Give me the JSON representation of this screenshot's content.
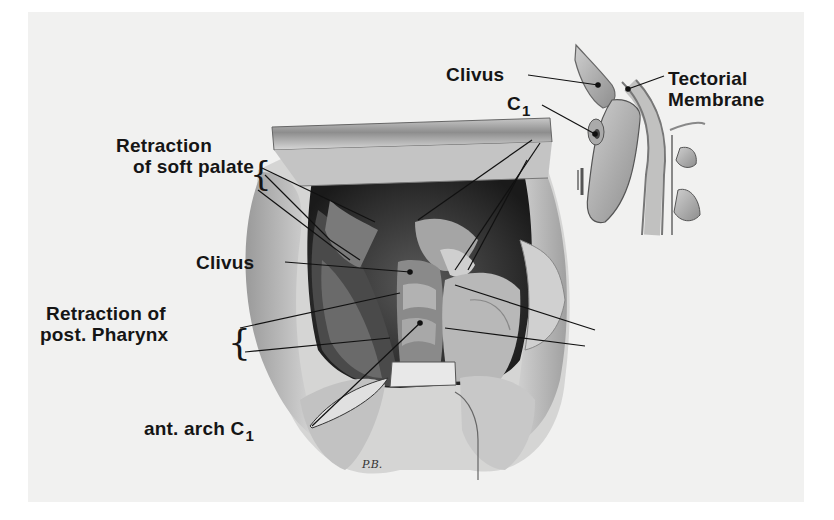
{
  "figure": {
    "labels": {
      "clivus_inset": "Clivus",
      "c1_inset": "C",
      "c1_inset_sub": "1",
      "tectorial_line1": "Tectorial",
      "tectorial_line2": "Membrane",
      "soft_palate_line1": "Retraction",
      "soft_palate_line2": "of soft palate",
      "clivus_main": "Clivus",
      "pharynx_line1": "Retraction of",
      "pharynx_line2": "post. Pharynx",
      "ant_arch": "ant. arch C",
      "ant_arch_sub": "1"
    },
    "signature": "P.B."
  }
}
